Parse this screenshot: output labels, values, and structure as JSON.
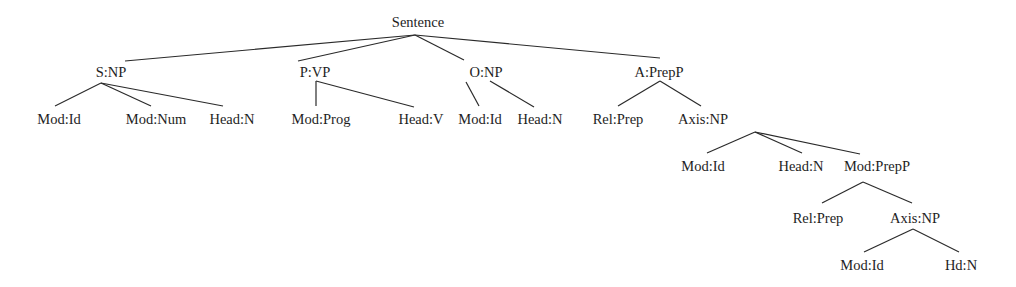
{
  "diagram": {
    "type": "syntactic-tree",
    "nodes": [
      {
        "id": "root",
        "label": "Sentence",
        "x": 418,
        "y": 27,
        "parent": null
      },
      {
        "id": "s-np",
        "label": "S:NP",
        "x": 111,
        "y": 77,
        "parent": "root"
      },
      {
        "id": "p-vp",
        "label": "P:VP",
        "x": 315,
        "y": 77,
        "parent": "root"
      },
      {
        "id": "o-np",
        "label": "O:NP",
        "x": 486,
        "y": 77,
        "parent": "root"
      },
      {
        "id": "a-prepp",
        "label": "A:PrepP",
        "x": 659,
        "y": 77,
        "parent": "root"
      },
      {
        "id": "mod-id-1",
        "label": "Mod:Id",
        "x": 59,
        "y": 124,
        "parent": "s-np"
      },
      {
        "id": "mod-num",
        "label": "Mod:Num",
        "x": 156,
        "y": 124,
        "parent": "s-np"
      },
      {
        "id": "head-n-1",
        "label": "Head:N",
        "x": 232,
        "y": 124,
        "parent": "s-np"
      },
      {
        "id": "mod-prog",
        "label": "Mod:Prog",
        "x": 321,
        "y": 124,
        "parent": "p-vp"
      },
      {
        "id": "head-v",
        "label": "Head:V",
        "x": 421,
        "y": 124,
        "parent": "p-vp"
      },
      {
        "id": "mod-id-2",
        "label": "Mod:Id",
        "x": 480,
        "y": 124,
        "parent": "o-np"
      },
      {
        "id": "head-n-2",
        "label": "Head:N",
        "x": 540,
        "y": 124,
        "parent": "o-np"
      },
      {
        "id": "rel-prep-1",
        "label": "Rel:Prep",
        "x": 618,
        "y": 124,
        "parent": "a-prepp"
      },
      {
        "id": "axis-np-1",
        "label": "Axis:NP",
        "x": 703,
        "y": 124,
        "parent": "a-prepp"
      },
      {
        "id": "mod-id-3",
        "label": "Mod:Id",
        "x": 703,
        "y": 171,
        "parent": "axis-np-1"
      },
      {
        "id": "head-n-3",
        "label": "Head:N",
        "x": 801,
        "y": 171,
        "parent": "axis-np-1"
      },
      {
        "id": "mod-prepp",
        "label": "Mod:PrepP",
        "x": 877,
        "y": 171,
        "parent": "axis-np-1"
      },
      {
        "id": "rel-prep-2",
        "label": "Rel:Prep",
        "x": 818,
        "y": 223,
        "parent": "mod-prepp"
      },
      {
        "id": "axis-np-2",
        "label": "Axis:NP",
        "x": 915,
        "y": 223,
        "parent": "mod-prepp"
      },
      {
        "id": "mod-id-4",
        "label": "Mod:Id",
        "x": 862,
        "y": 270,
        "parent": "axis-np-2"
      },
      {
        "id": "hd-n",
        "label": "Hd:N",
        "x": 961,
        "y": 270,
        "parent": "axis-np-2"
      }
    ],
    "edges": [
      {
        "from": "root",
        "to": "s-np",
        "x1": 415,
        "y1": 35,
        "x2": 125,
        "y2": 61
      },
      {
        "from": "root",
        "to": "p-vp",
        "x1": 415,
        "y1": 35,
        "x2": 298,
        "y2": 61
      },
      {
        "from": "root",
        "to": "o-np",
        "x1": 415,
        "y1": 35,
        "x2": 464,
        "y2": 60
      },
      {
        "from": "root",
        "to": "a-prepp",
        "x1": 415,
        "y1": 35,
        "x2": 660,
        "y2": 58
      },
      {
        "from": "s-np",
        "to": "mod-id-1",
        "x1": 101,
        "y1": 83,
        "x2": 55,
        "y2": 106
      },
      {
        "from": "s-np",
        "to": "mod-num",
        "x1": 101,
        "y1": 83,
        "x2": 151,
        "y2": 106
      },
      {
        "from": "s-np",
        "to": "head-n-1",
        "x1": 101,
        "y1": 83,
        "x2": 223,
        "y2": 106
      },
      {
        "from": "p-vp",
        "to": "mod-prog",
        "x1": 316,
        "y1": 81,
        "x2": 316,
        "y2": 106
      },
      {
        "from": "p-vp",
        "to": "head-v",
        "x1": 316,
        "y1": 81,
        "x2": 414,
        "y2": 107
      },
      {
        "from": "o-np",
        "to": "mod-id-2",
        "x1": 466,
        "y1": 82,
        "x2": 479,
        "y2": 106
      },
      {
        "from": "o-np",
        "to": "head-n-2",
        "x1": 490,
        "y1": 81,
        "x2": 534,
        "y2": 107
      },
      {
        "from": "a-prepp",
        "to": "rel-prep-1",
        "x1": 660,
        "y1": 81,
        "x2": 618,
        "y2": 106
      },
      {
        "from": "a-prepp",
        "to": "axis-np-1",
        "x1": 660,
        "y1": 81,
        "x2": 701,
        "y2": 106
      },
      {
        "from": "axis-np-1",
        "to": "mod-id-3",
        "x1": 755,
        "y1": 132,
        "x2": 707,
        "y2": 153
      },
      {
        "from": "axis-np-1",
        "to": "head-n-3",
        "x1": 755,
        "y1": 132,
        "x2": 802,
        "y2": 153
      },
      {
        "from": "axis-np-1",
        "to": "mod-prepp",
        "x1": 755,
        "y1": 132,
        "x2": 860,
        "y2": 154
      },
      {
        "from": "mod-prepp",
        "to": "rel-prep-2",
        "x1": 863,
        "y1": 182,
        "x2": 822,
        "y2": 203
      },
      {
        "from": "mod-prepp",
        "to": "axis-np-2",
        "x1": 863,
        "y1": 182,
        "x2": 912,
        "y2": 203
      },
      {
        "from": "axis-np-2",
        "to": "mod-id-4",
        "x1": 913,
        "y1": 229,
        "x2": 864,
        "y2": 252
      },
      {
        "from": "axis-np-2",
        "to": "hd-n",
        "x1": 913,
        "y1": 229,
        "x2": 959,
        "y2": 252
      }
    ]
  }
}
